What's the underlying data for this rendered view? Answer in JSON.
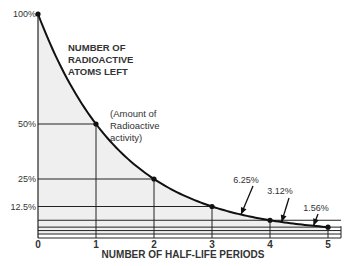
{
  "chart_data": {
    "type": "line",
    "title": "",
    "xlabel": "NUMBER OF HALF-LIFE PERIODS",
    "ylabel": "",
    "x": [
      0,
      1,
      2,
      3,
      4,
      5
    ],
    "series": [
      {
        "name": "Number of radioactive atoms left",
        "values": [
          100,
          50,
          25,
          12.5,
          6.25,
          3.12
        ]
      }
    ],
    "x_ticks": [
      "0",
      "1",
      "2",
      "3",
      "4",
      "5"
    ],
    "y_ticks": [
      {
        "value": 100,
        "label": "100%"
      },
      {
        "value": 50,
        "label": "50%"
      },
      {
        "value": 25,
        "label": "25%"
      },
      {
        "value": 12.5,
        "label": "12.5%"
      }
    ],
    "xlim": [
      0,
      5
    ],
    "ylim": [
      0,
      100
    ],
    "extra_levels": [
      6.25,
      3.12,
      1.56
    ],
    "annotations": [
      {
        "text": "NUMBER OF\nRADIOACTIVE\nATOMS LEFT",
        "lines": [
          "NUMBER OF",
          "RADIOACTIVE",
          "ATOMS LEFT"
        ]
      },
      {
        "text": "(Amount of\nRadioactive\nactivity)",
        "lines": [
          "(Amount of",
          "Radioactive",
          "activity)"
        ]
      },
      {
        "text": "6.25%",
        "points_to_x": 3.5
      },
      {
        "text": "3.12%",
        "points_to_x": 4.2
      },
      {
        "text": "1.56%",
        "points_to_x": 4.75
      }
    ],
    "grid": false,
    "legend": "none",
    "colors": {
      "curve": "#111111",
      "fill": "#efefef",
      "lines": "#222222"
    }
  }
}
